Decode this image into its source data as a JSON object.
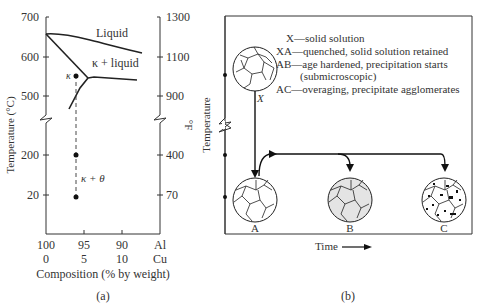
{
  "panel_a": {
    "caption": "(a)",
    "left_axis": {
      "label": "Temperature (°C)",
      "ticks": [
        {
          "label": "700",
          "y": 17
        },
        {
          "label": "600",
          "y": 57
        },
        {
          "label": "500",
          "y": 96
        },
        {
          "label": "200",
          "y": 155
        },
        {
          "label": "20",
          "y": 195
        }
      ]
    },
    "right_axis": {
      "label": "°F",
      "ticks": [
        {
          "label": "1300",
          "y": 17
        },
        {
          "label": "1100",
          "y": 57
        },
        {
          "label": "900",
          "y": 96
        },
        {
          "label": "400",
          "y": 155
        },
        {
          "label": "70",
          "y": 195
        }
      ]
    },
    "bottom_axis": {
      "label": "Composition (% by  weight)",
      "ticks_top": [
        "100",
        "95",
        "90",
        "Al"
      ],
      "ticks_bottom": [
        "0",
        "5",
        "10",
        "Cu"
      ]
    },
    "regions": {
      "liquid": "Liquid",
      "kappa_liquid": "κ + liquid",
      "kappa": "κ",
      "kappa_theta": "κ + θ"
    }
  },
  "panel_b": {
    "caption": "(b)",
    "y_label": "Temperature",
    "x_label": "Time",
    "legend": [
      "X—solid solution",
      "XA—quenched, solid solution retained",
      "AB—age hardened, precipitation starts",
      "(submicroscopic)",
      "AC—overaging, precipitate agglomerates"
    ],
    "states": {
      "X": "X",
      "A": "A",
      "B": "B",
      "C": "C"
    }
  },
  "colors": {
    "line": "#222222",
    "text": "#333333",
    "grain_fill_b": "#e4e4e4",
    "background": "#ffffff"
  }
}
